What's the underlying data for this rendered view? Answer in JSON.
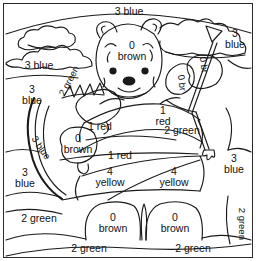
{
  "page": {
    "kind": "color-by-number-coloring-page",
    "frame_color": "#2b2b2b",
    "ink_color": "#1a1a1a",
    "background_color": "#ffffff"
  },
  "palette_key": {
    "0": "brown",
    "1": "red",
    "2": "green",
    "3": "blue",
    "4": "yellow"
  },
  "regions": [
    {
      "id": "sky-top",
      "number": "3",
      "color": "blue",
      "label": "3 blue",
      "orientation": "horizontal"
    },
    {
      "id": "sky-upper-left",
      "number": "3",
      "color": "blue",
      "label": "3 blue",
      "orientation": "horizontal"
    },
    {
      "id": "sky-left",
      "number": "3",
      "color": "blue",
      "label": "3 blue",
      "orientation": "horizontal"
    },
    {
      "id": "sky-upper-right",
      "number": "3",
      "color": "blue",
      "label": "3 blue",
      "orientation": "horizontal"
    },
    {
      "id": "sky-right",
      "number": "3",
      "color": "blue",
      "label": "3 blue",
      "orientation": "horizontal"
    },
    {
      "id": "hill-left",
      "number": "3",
      "color": "blue",
      "label": "3 blue",
      "orientation": "horizontal"
    },
    {
      "id": "bow-string",
      "number": "3",
      "color": "blue",
      "label": "3 blue",
      "orientation": "diagonal"
    },
    {
      "id": "bear-head",
      "number": "0",
      "color": "brown",
      "label": "0 brown",
      "orientation": "horizontal"
    },
    {
      "id": "bear-paw-left",
      "number": "0",
      "color": "brown",
      "label": "0 brown",
      "orientation": "horizontal"
    },
    {
      "id": "bear-foot-left",
      "number": "0",
      "color": "brown",
      "label": "0 brown",
      "orientation": "horizontal"
    },
    {
      "id": "bear-foot-right",
      "number": "0",
      "color": "brown",
      "label": "0 brown",
      "orientation": "horizontal"
    },
    {
      "id": "arrow-fletch-a",
      "number": "0",
      "color": "br",
      "label": "0 br",
      "orientation": "rotated"
    },
    {
      "id": "arrow-fletch-b",
      "number": "0",
      "color": "br",
      "label": "0 br",
      "orientation": "rotated"
    },
    {
      "id": "shirt-upper",
      "number": "1",
      "color": "red",
      "label": "1 red",
      "orientation": "horizontal"
    },
    {
      "id": "shirt-mid",
      "number": "1",
      "color": "red",
      "label": "1 red",
      "orientation": "horizontal"
    },
    {
      "id": "sleeve-right",
      "number": "1",
      "color": "red",
      "label": "1 red",
      "orientation": "horizontal"
    },
    {
      "id": "bow-quiver",
      "number": "2",
      "color": "green",
      "label": "2 green",
      "orientation": "diagonal"
    },
    {
      "id": "shirt-lower",
      "number": "2",
      "color": "green",
      "label": "2 green",
      "orientation": "horizontal"
    },
    {
      "id": "grass-left",
      "number": "2",
      "color": "green",
      "label": "2 green",
      "orientation": "horizontal"
    },
    {
      "id": "grass-bottom-l",
      "number": "2",
      "color": "green",
      "label": "2 green",
      "orientation": "horizontal"
    },
    {
      "id": "grass-bottom-r",
      "number": "2",
      "color": "green",
      "label": "2 green",
      "orientation": "horizontal"
    },
    {
      "id": "grass-right",
      "number": "2",
      "color": "green",
      "label": "2 green",
      "orientation": "vertical"
    },
    {
      "id": "pants-left",
      "number": "4",
      "color": "yellow",
      "label": "4 yellow",
      "orientation": "horizontal"
    },
    {
      "id": "pants-right",
      "number": "4",
      "color": "yellow",
      "label": "4 yellow",
      "orientation": "horizontal"
    }
  ],
  "labels": {
    "sky_top": {
      "num": "3",
      "col": "blue"
    },
    "sky_upper_left": {
      "num": "3",
      "col": "blue"
    },
    "sky_left": {
      "num": "3",
      "col": "blue"
    },
    "sky_upper_right": {
      "num": "3",
      "col": "blue"
    },
    "sky_right": {
      "num": "3",
      "col": "blue"
    },
    "hill_left": {
      "num": "3",
      "col": "blue"
    },
    "bow_string": {
      "text": "3 blue"
    },
    "bear_head": {
      "num": "0",
      "col": "brown"
    },
    "bear_paw_left": {
      "num": "0",
      "col": "brown"
    },
    "bear_foot_left": {
      "num": "0",
      "col": "brown"
    },
    "bear_foot_right": {
      "num": "0",
      "col": "brown"
    },
    "fletch_a": {
      "text": "0 br"
    },
    "fletch_b": {
      "text": "0 br"
    },
    "shirt_upper": {
      "text": "1 red"
    },
    "shirt_mid": {
      "text": "1 red"
    },
    "sleeve_right": {
      "num": "1",
      "col": "red"
    },
    "quiver": {
      "text": "2 green"
    },
    "shirt_lower": {
      "text": "2 green"
    },
    "grass_left": {
      "text": "2 green"
    },
    "grass_bottom_l": {
      "text": "2 green"
    },
    "grass_bottom_r": {
      "text": "2 green"
    },
    "grass_right": {
      "text": "2 green"
    },
    "pants_left": {
      "num": "4",
      "col": "yellow"
    },
    "pants_right": {
      "num": "4",
      "col": "yellow"
    }
  }
}
